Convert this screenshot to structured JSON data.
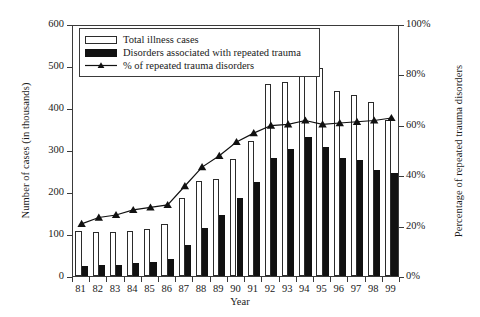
{
  "chart_data": {
    "type": "bar",
    "title": "",
    "xlabel": "Year",
    "ylabel": "Number of cases (in thousands)",
    "ylabel_right": "Percentage of repeated trauma disorders",
    "categories": [
      "81",
      "82",
      "83",
      "84",
      "85",
      "86",
      "87",
      "88",
      "89",
      "90",
      "91",
      "92",
      "93",
      "94",
      "95",
      "96",
      "97",
      "98",
      "99"
    ],
    "ylim": [
      0,
      600
    ],
    "yticks": [
      0,
      100,
      200,
      300,
      400,
      500,
      600
    ],
    "ytick_labels": [
      "0",
      "100",
      "200",
      "300",
      "400",
      "500",
      "600"
    ],
    "ylim_right": [
      0,
      100
    ],
    "yticks_right": [
      0,
      20,
      40,
      60,
      80,
      100
    ],
    "ytick_labels_right": [
      "0%",
      "20%",
      "40%",
      "60%",
      "80%",
      "100%"
    ],
    "grid": false,
    "legend_position": "upper-left",
    "series": [
      {
        "name": "Total illness cases",
        "type": "bar",
        "axis": "left",
        "color": "#ffffff",
        "edgecolor": "#2b2b2b",
        "values": [
          106,
          104,
          105,
          107,
          112,
          124,
          185,
          226,
          232,
          278,
          321,
          458,
          463,
          515,
          495,
          441,
          430,
          415,
          372
        ]
      },
      {
        "name": "Disorders associated with repeated trauma",
        "type": "bar",
        "axis": "left",
        "color": "#111111",
        "edgecolor": "#111111",
        "values": [
          23,
          27,
          26,
          30,
          34,
          41,
          73,
          115,
          146,
          185,
          223,
          282,
          302,
          332,
          308,
          281,
          277,
          253,
          246
        ]
      },
      {
        "name": "% of repeated trauma disorders",
        "type": "line",
        "axis": "right",
        "color": "#111111",
        "marker": "triangle",
        "values": [
          21.5,
          24.0,
          25.0,
          27.0,
          28.0,
          29.0,
          36.5,
          44.0,
          48.5,
          54.0,
          57.5,
          60.5,
          61.0,
          62.5,
          61.0,
          61.5,
          62.0,
          62.5,
          63.5
        ]
      }
    ]
  },
  "legend": {
    "items": [
      {
        "label": "Total illness cases",
        "key": "white-bar-swatch"
      },
      {
        "label": "Disorders associated with repeated trauma",
        "key": "black-bar-swatch"
      },
      {
        "label": "% of repeated trauma disorders",
        "key": "line-triangle-swatch"
      }
    ]
  },
  "colors": {
    "axis": "#3a3a3a",
    "text": "#1a1a1a",
    "bar_total_fill": "#ffffff",
    "bar_total_edge": "#2b2b2b",
    "bar_disorders_fill": "#111111",
    "line": "#111111",
    "background": "#ffffff"
  }
}
